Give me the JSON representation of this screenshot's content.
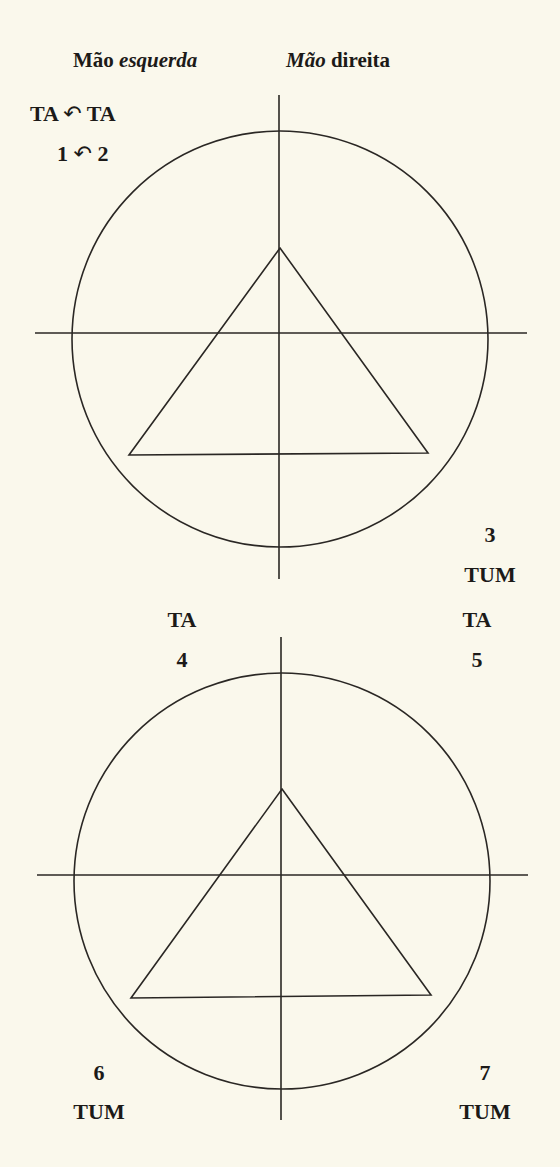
{
  "header": {
    "left": {
      "word1": "Mão",
      "word2": "esquerda"
    },
    "right": {
      "word1": "Mão",
      "word2": "direita"
    }
  },
  "counts": {
    "first": {
      "syllables": [
        "TA",
        "TA"
      ],
      "numbers": [
        "1",
        "2"
      ],
      "connector_icon": "anticlockwise-arc-arrow",
      "connector_glyph": "↶"
    },
    "beat3": {
      "number": "3",
      "syllable": "TUM"
    },
    "beat4": {
      "syllable": "TA",
      "number": "4"
    },
    "beat5": {
      "syllable": "TA",
      "number": "5"
    },
    "beat6": {
      "number": "6",
      "syllable": "TUM"
    },
    "beat7": {
      "number": "7",
      "syllable": "TUM"
    }
  },
  "diagrams": [
    {
      "circle": {
        "cx": 280,
        "cy": 339,
        "r": 208
      },
      "vertical_axis": {
        "x": 279,
        "y1": 95,
        "y2": 579
      },
      "horizontal_axis": {
        "y": 333,
        "x1": 35,
        "x2": 527
      },
      "triangle": [
        [
          280,
          248
        ],
        [
          428,
          453
        ],
        [
          129,
          455
        ]
      ]
    },
    {
      "circle": {
        "cx": 282,
        "cy": 881,
        "r": 208
      },
      "vertical_axis": {
        "x": 281,
        "y1": 637,
        "y2": 1120
      },
      "horizontal_axis": {
        "y": 875,
        "x1": 37,
        "x2": 528
      },
      "triangle": [
        [
          282,
          789
        ],
        [
          431,
          995
        ],
        [
          131,
          998
        ]
      ]
    }
  ],
  "colors": {
    "background": "#faf8ec",
    "ink": "#1c1a18"
  }
}
